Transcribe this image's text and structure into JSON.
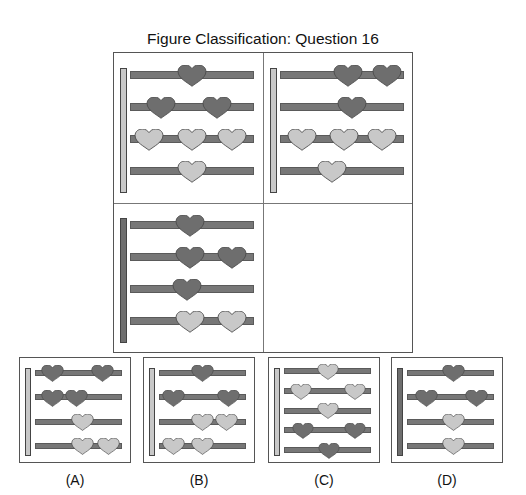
{
  "title": "Figure Classification: Question 16",
  "colors": {
    "dark": "#6e6e6e",
    "light": "#c8c8c8",
    "rod": "#777777",
    "border": "#555555"
  },
  "grid": {
    "cells": [
      {
        "id": "cell-1",
        "bar": "light",
        "rows": [
          {
            "hearts": [
              {
                "pos": 0.5,
                "c": "dark"
              }
            ]
          },
          {
            "hearts": [
              {
                "pos": 0.25,
                "c": "dark"
              },
              {
                "pos": 0.7,
                "c": "dark"
              }
            ]
          },
          {
            "hearts": [
              {
                "pos": 0.15,
                "c": "light"
              },
              {
                "pos": 0.5,
                "c": "light"
              },
              {
                "pos": 0.82,
                "c": "light"
              }
            ]
          },
          {
            "hearts": [
              {
                "pos": 0.5,
                "c": "light"
              }
            ]
          }
        ]
      },
      {
        "id": "cell-2",
        "bar": "light",
        "rows": [
          {
            "hearts": [
              {
                "pos": 0.55,
                "c": "dark"
              },
              {
                "pos": 0.86,
                "c": "dark"
              }
            ]
          },
          {
            "hearts": [
              {
                "pos": 0.58,
                "c": "dark"
              }
            ]
          },
          {
            "hearts": [
              {
                "pos": 0.18,
                "c": "light"
              },
              {
                "pos": 0.52,
                "c": "light"
              },
              {
                "pos": 0.82,
                "c": "light"
              }
            ]
          },
          {
            "hearts": [
              {
                "pos": 0.42,
                "c": "light"
              }
            ]
          }
        ]
      },
      {
        "id": "cell-3",
        "bar": "dark",
        "rows": [
          {
            "hearts": [
              {
                "pos": 0.48,
                "c": "dark"
              }
            ]
          },
          {
            "hearts": [
              {
                "pos": 0.48,
                "c": "dark"
              },
              {
                "pos": 0.82,
                "c": "dark"
              }
            ]
          },
          {
            "hearts": [
              {
                "pos": 0.46,
                "c": "dark"
              }
            ]
          },
          {
            "hearts": [
              {
                "pos": 0.48,
                "c": "light"
              },
              {
                "pos": 0.82,
                "c": "light"
              }
            ]
          }
        ]
      },
      {
        "id": "cell-4",
        "empty": true
      }
    ]
  },
  "options": [
    {
      "label": "(A)",
      "bar": "light",
      "rows": [
        {
          "hearts": [
            {
              "pos": 0.2,
              "c": "dark"
            },
            {
              "pos": 0.78,
              "c": "dark"
            }
          ]
        },
        {
          "hearts": [
            {
              "pos": 0.2,
              "c": "dark"
            },
            {
              "pos": 0.48,
              "c": "dark"
            }
          ]
        },
        {
          "hearts": [
            {
              "pos": 0.55,
              "c": "light"
            }
          ]
        },
        {
          "hearts": [
            {
              "pos": 0.55,
              "c": "light"
            },
            {
              "pos": 0.85,
              "c": "light"
            }
          ]
        }
      ]
    },
    {
      "label": "(B)",
      "bar": "light",
      "rows": [
        {
          "hearts": [
            {
              "pos": 0.5,
              "c": "dark"
            }
          ]
        },
        {
          "hearts": [
            {
              "pos": 0.17,
              "c": "dark"
            },
            {
              "pos": 0.8,
              "c": "dark"
            }
          ]
        },
        {
          "hearts": [
            {
              "pos": 0.5,
              "c": "light"
            },
            {
              "pos": 0.78,
              "c": "light"
            }
          ]
        },
        {
          "hearts": [
            {
              "pos": 0.17,
              "c": "light"
            },
            {
              "pos": 0.5,
              "c": "light"
            }
          ]
        }
      ]
    },
    {
      "label": "(C)",
      "bar": "light",
      "rows": [
        {
          "hearts": [
            {
              "pos": 0.5,
              "c": "light"
            }
          ]
        },
        {
          "hearts": [
            {
              "pos": 0.2,
              "c": "light"
            },
            {
              "pos": 0.82,
              "c": "light"
            }
          ]
        },
        {
          "hearts": [
            {
              "pos": 0.5,
              "c": "light"
            }
          ]
        },
        {
          "hearts": [
            {
              "pos": 0.22,
              "c": "dark"
            },
            {
              "pos": 0.82,
              "c": "dark"
            }
          ]
        },
        {
          "hearts": [
            {
              "pos": 0.52,
              "c": "dark"
            }
          ]
        }
      ]
    },
    {
      "label": "(D)",
      "bar": "dark",
      "rows": [
        {
          "hearts": [
            {
              "pos": 0.53,
              "c": "dark"
            }
          ]
        },
        {
          "hearts": [
            {
              "pos": 0.22,
              "c": "dark"
            },
            {
              "pos": 0.8,
              "c": "dark"
            }
          ]
        },
        {
          "hearts": [
            {
              "pos": 0.53,
              "c": "light"
            }
          ]
        },
        {
          "hearts": [
            {
              "pos": 0.53,
              "c": "light"
            }
          ]
        }
      ]
    }
  ]
}
